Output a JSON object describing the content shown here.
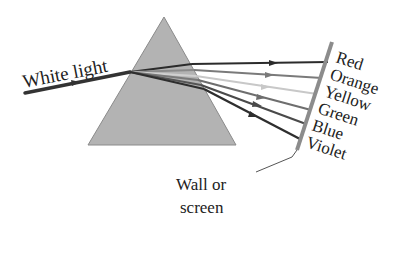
{
  "diagram": {
    "incoming_label": "White light",
    "spectrum": [
      {
        "name": "Red",
        "stroke": "#2b2b2b"
      },
      {
        "name": "Orange",
        "stroke": "#7a7a7a"
      },
      {
        "name": "Yellow",
        "stroke": "#c8c8c8"
      },
      {
        "name": "Green",
        "stroke": "#6e6e6e"
      },
      {
        "name": "Blue",
        "stroke": "#4a4a4a"
      },
      {
        "name": "Violet",
        "stroke": "#2e2e2e"
      }
    ],
    "wall_label_line1": "Wall or",
    "wall_label_line2": "screen",
    "colors": {
      "prism_fill": "#b3b3b3",
      "prism_edge": "#8a8a8a",
      "wall": "#8c8c8c",
      "ray": "#333333"
    }
  }
}
